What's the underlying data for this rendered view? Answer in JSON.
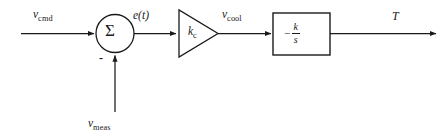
{
  "diagram": {
    "type": "control-block-diagram",
    "stroke_color": "#1a1a1a",
    "background_color": "#ffffff",
    "signals": {
      "command_input": {
        "base": "v",
        "sub": "cmd"
      },
      "error": "e(t)",
      "controller_output": {
        "base": "v",
        "sub": "cool"
      },
      "feedback": {
        "base": "v",
        "sub": "meas"
      },
      "output": "T"
    },
    "summing_junction": {
      "symbol": "Σ",
      "feedback_sign": "-"
    },
    "gain_block": {
      "shape": "triangle",
      "base": "k",
      "sub": "c"
    },
    "plant_block": {
      "shape": "rectangle",
      "sign": "−",
      "numerator": "k",
      "denominator": "s"
    }
  }
}
